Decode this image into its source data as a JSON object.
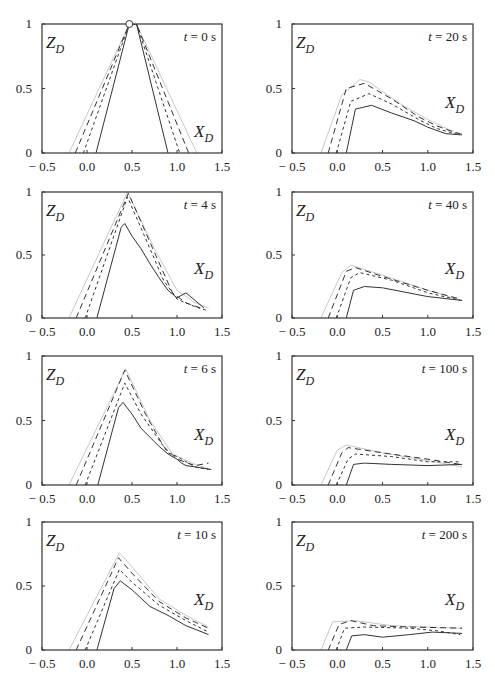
{
  "figure": {
    "ylabel": "Z",
    "ylabel_sub": "D",
    "xlabel": "X",
    "xlabel_sub": "D",
    "xticks": [
      "− 0.5",
      "0.0",
      "0.5",
      "1.0",
      "1.5"
    ],
    "xtick_values": [
      -0.5,
      0.0,
      0.5,
      1.0,
      1.5
    ],
    "yticks": [
      "0",
      "0.5",
      "1"
    ],
    "ytick_values": [
      0,
      0.5,
      1
    ],
    "line_styles": {
      "outer": {
        "stroke": "#c8c8c8",
        "dash": "",
        "width": 1
      },
      "dash_long": {
        "stroke": "#333333",
        "dash": "6,4",
        "width": 1
      },
      "dash_short": {
        "stroke": "#333333",
        "dash": "3,3",
        "width": 1
      },
      "solid": {
        "stroke": "#333333",
        "dash": "",
        "width": 1
      }
    }
  },
  "chart_data": [
    {
      "type": "line",
      "title": "t = 0 s",
      "xlabel": "X_D",
      "ylabel": "Z_D",
      "xlim": [
        -0.5,
        1.5
      ],
      "ylim": [
        0,
        1
      ],
      "marker": {
        "x": 0.47,
        "y": 1.0,
        "shape": "open-circle"
      },
      "series": [
        {
          "name": "outer",
          "points": [
            [
              -0.2,
              0
            ],
            [
              0.47,
              1.0
            ],
            [
              0.55,
              1.0
            ],
            [
              1.22,
              0
            ]
          ]
        },
        {
          "name": "dash_long",
          "points": [
            [
              -0.13,
              0
            ],
            [
              0.47,
              1.0
            ],
            [
              0.55,
              1.0
            ],
            [
              1.13,
              0
            ]
          ]
        },
        {
          "name": "dash_short",
          "points": [
            [
              -0.04,
              0
            ],
            [
              0.47,
              1.0
            ],
            [
              0.55,
              1.0
            ],
            [
              1.03,
              0
            ]
          ]
        },
        {
          "name": "solid",
          "points": [
            [
              0.1,
              0
            ],
            [
              0.47,
              1.0
            ],
            [
              0.55,
              1.0
            ],
            [
              0.9,
              0
            ]
          ]
        }
      ]
    },
    {
      "type": "line",
      "title": "t = 20 s",
      "xlabel": "X_D",
      "ylabel": "Z_D",
      "xlim": [
        -0.5,
        1.5
      ],
      "ylim": [
        0,
        1
      ],
      "series": [
        {
          "name": "outer",
          "points": [
            [
              -0.18,
              0
            ],
            [
              0.05,
              0.45
            ],
            [
              0.25,
              0.57
            ],
            [
              0.35,
              0.55
            ],
            [
              0.7,
              0.38
            ],
            [
              1.0,
              0.26
            ],
            [
              1.3,
              0.16
            ],
            [
              1.38,
              0.15
            ]
          ]
        },
        {
          "name": "dash_long",
          "points": [
            [
              -0.1,
              0
            ],
            [
              0.1,
              0.5
            ],
            [
              0.3,
              0.54
            ],
            [
              0.6,
              0.42
            ],
            [
              0.9,
              0.28
            ],
            [
              1.1,
              0.21
            ],
            [
              1.3,
              0.16
            ],
            [
              1.36,
              0.15
            ]
          ]
        },
        {
          "name": "dash_short",
          "points": [
            [
              -0.01,
              0
            ],
            [
              0.15,
              0.4
            ],
            [
              0.35,
              0.46
            ],
            [
              0.6,
              0.38
            ],
            [
              0.9,
              0.26
            ],
            [
              1.1,
              0.19
            ],
            [
              1.3,
              0.15
            ],
            [
              1.36,
              0.14
            ]
          ]
        },
        {
          "name": "solid",
          "points": [
            [
              0.1,
              0
            ],
            [
              0.2,
              0.34
            ],
            [
              0.38,
              0.37
            ],
            [
              0.6,
              0.31
            ],
            [
              0.85,
              0.25
            ],
            [
              1.0,
              0.2
            ],
            [
              1.2,
              0.15
            ],
            [
              1.38,
              0.14
            ]
          ]
        }
      ]
    },
    {
      "type": "line",
      "title": "t = 4 s",
      "xlabel": "X_D",
      "ylabel": "Z_D",
      "xlim": [
        -0.5,
        1.5
      ],
      "ylim": [
        0,
        1
      ],
      "series": [
        {
          "name": "outer",
          "points": [
            [
              -0.2,
              0
            ],
            [
              0.45,
              1.0
            ],
            [
              0.75,
              0.55
            ],
            [
              1.0,
              0.22
            ],
            [
              1.2,
              0.12
            ],
            [
              1.35,
              0.08
            ]
          ]
        },
        {
          "name": "dash_long",
          "points": [
            [
              -0.12,
              0
            ],
            [
              0.46,
              0.99
            ],
            [
              0.75,
              0.52
            ],
            [
              0.95,
              0.2
            ],
            [
              1.1,
              0.12
            ],
            [
              1.3,
              0.07
            ]
          ]
        },
        {
          "name": "dash_short",
          "points": [
            [
              -0.02,
              0
            ],
            [
              0.45,
              0.96
            ],
            [
              0.7,
              0.55
            ],
            [
              0.85,
              0.3
            ],
            [
              1.0,
              0.15
            ],
            [
              1.2,
              0.09
            ],
            [
              1.33,
              0.06
            ]
          ]
        },
        {
          "name": "solid",
          "points": [
            [
              0.11,
              0
            ],
            [
              0.38,
              0.72
            ],
            [
              0.42,
              0.75
            ],
            [
              0.5,
              0.65
            ],
            [
              0.6,
              0.55
            ],
            [
              0.7,
              0.43
            ],
            [
              0.8,
              0.32
            ],
            [
              0.9,
              0.22
            ],
            [
              1.0,
              0.16
            ],
            [
              1.1,
              0.2
            ],
            [
              1.2,
              0.14
            ],
            [
              1.3,
              0.08
            ]
          ]
        }
      ]
    },
    {
      "type": "line",
      "title": "t = 40 s",
      "xlabel": "X_D",
      "ylabel": "Z_D",
      "xlim": [
        -0.5,
        1.5
      ],
      "ylim": [
        0,
        1
      ],
      "series": [
        {
          "name": "outer",
          "points": [
            [
              -0.18,
              0
            ],
            [
              0.05,
              0.36
            ],
            [
              0.15,
              0.42
            ],
            [
              0.5,
              0.34
            ],
            [
              1.0,
              0.22
            ],
            [
              1.38,
              0.14
            ]
          ]
        },
        {
          "name": "dash_long",
          "points": [
            [
              -0.1,
              0
            ],
            [
              0.1,
              0.37
            ],
            [
              0.2,
              0.4
            ],
            [
              0.5,
              0.33
            ],
            [
              1.0,
              0.22
            ],
            [
              1.36,
              0.15
            ]
          ]
        },
        {
          "name": "dash_short",
          "points": [
            [
              -0.01,
              0
            ],
            [
              0.15,
              0.32
            ],
            [
              0.25,
              0.36
            ],
            [
              0.6,
              0.3
            ],
            [
              1.0,
              0.2
            ],
            [
              1.36,
              0.14
            ]
          ]
        },
        {
          "name": "solid",
          "points": [
            [
              0.1,
              0
            ],
            [
              0.18,
              0.22
            ],
            [
              0.3,
              0.25
            ],
            [
              0.5,
              0.24
            ],
            [
              1.0,
              0.17
            ],
            [
              1.38,
              0.14
            ]
          ]
        }
      ]
    },
    {
      "type": "line",
      "title": "t = 6 s",
      "xlabel": "X_D",
      "ylabel": "Z_D",
      "xlim": [
        -0.5,
        1.5
      ],
      "ylim": [
        0,
        1
      ],
      "series": [
        {
          "name": "outer",
          "points": [
            [
              -0.2,
              0
            ],
            [
              0.43,
              0.9
            ],
            [
              0.7,
              0.5
            ],
            [
              0.95,
              0.24
            ],
            [
              1.2,
              0.16
            ],
            [
              1.38,
              0.12
            ]
          ]
        },
        {
          "name": "dash_long",
          "points": [
            [
              -0.12,
              0
            ],
            [
              0.42,
              0.89
            ],
            [
              0.65,
              0.55
            ],
            [
              0.85,
              0.3
            ],
            [
              1.0,
              0.2
            ],
            [
              1.2,
              0.15
            ],
            [
              1.35,
              0.17
            ]
          ]
        },
        {
          "name": "dash_short",
          "points": [
            [
              -0.02,
              0
            ],
            [
              0.42,
              0.79
            ],
            [
              0.6,
              0.55
            ],
            [
              0.8,
              0.35
            ],
            [
              0.9,
              0.25
            ],
            [
              1.0,
              0.22
            ],
            [
              1.2,
              0.14
            ],
            [
              1.35,
              0.12
            ]
          ]
        },
        {
          "name": "solid",
          "points": [
            [
              0.12,
              0
            ],
            [
              0.35,
              0.6
            ],
            [
              0.4,
              0.64
            ],
            [
              0.5,
              0.55
            ],
            [
              0.6,
              0.44
            ],
            [
              0.7,
              0.37
            ],
            [
              0.8,
              0.3
            ],
            [
              0.9,
              0.24
            ],
            [
              1.0,
              0.2
            ],
            [
              1.05,
              0.17
            ],
            [
              1.1,
              0.15
            ],
            [
              1.2,
              0.14
            ],
            [
              1.38,
              0.12
            ]
          ]
        }
      ]
    },
    {
      "type": "line",
      "title": "t = 100 s",
      "xlabel": "X_D",
      "ylabel": "Z_D",
      "xlim": [
        -0.5,
        1.5
      ],
      "ylim": [
        0,
        1
      ],
      "series": [
        {
          "name": "outer",
          "points": [
            [
              -0.18,
              0
            ],
            [
              0.0,
              0.27
            ],
            [
              0.1,
              0.31
            ],
            [
              0.5,
              0.25
            ],
            [
              1.0,
              0.19
            ],
            [
              1.38,
              0.14
            ]
          ]
        },
        {
          "name": "dash_long",
          "points": [
            [
              -0.1,
              0
            ],
            [
              0.05,
              0.25
            ],
            [
              0.12,
              0.29
            ],
            [
              0.5,
              0.25
            ],
            [
              1.0,
              0.2
            ],
            [
              1.36,
              0.16
            ]
          ]
        },
        {
          "name": "dash_short",
          "points": [
            [
              -0.01,
              0
            ],
            [
              0.12,
              0.2
            ],
            [
              0.2,
              0.24
            ],
            [
              0.6,
              0.22
            ],
            [
              1.0,
              0.18
            ],
            [
              1.36,
              0.18
            ]
          ]
        },
        {
          "name": "solid",
          "points": [
            [
              0.1,
              0
            ],
            [
              0.18,
              0.16
            ],
            [
              0.3,
              0.17
            ],
            [
              0.6,
              0.16
            ],
            [
              1.0,
              0.15
            ],
            [
              1.38,
              0.16
            ]
          ]
        }
      ]
    },
    {
      "type": "line",
      "title": "t = 10 s",
      "xlabel": "X_D",
      "ylabel": "Z_D",
      "xlim": [
        -0.5,
        1.5
      ],
      "ylim": [
        0,
        1
      ],
      "series": [
        {
          "name": "outer",
          "points": [
            [
              -0.2,
              0
            ],
            [
              0.36,
              0.76
            ],
            [
              0.5,
              0.65
            ],
            [
              0.8,
              0.4
            ],
            [
              1.1,
              0.27
            ],
            [
              1.35,
              0.18
            ]
          ]
        },
        {
          "name": "dash_long",
          "points": [
            [
              -0.12,
              0
            ],
            [
              0.35,
              0.72
            ],
            [
              0.5,
              0.6
            ],
            [
              0.8,
              0.38
            ],
            [
              1.1,
              0.25
            ],
            [
              1.35,
              0.17
            ]
          ]
        },
        {
          "name": "dash_short",
          "points": [
            [
              -0.02,
              0
            ],
            [
              0.36,
              0.63
            ],
            [
              0.5,
              0.53
            ],
            [
              0.8,
              0.35
            ],
            [
              1.1,
              0.23
            ],
            [
              1.35,
              0.14
            ]
          ]
        },
        {
          "name": "solid",
          "points": [
            [
              0.11,
              0
            ],
            [
              0.3,
              0.48
            ],
            [
              0.37,
              0.54
            ],
            [
              0.5,
              0.47
            ],
            [
              0.7,
              0.34
            ],
            [
              0.9,
              0.27
            ],
            [
              1.1,
              0.19
            ],
            [
              1.35,
              0.12
            ]
          ]
        }
      ]
    },
    {
      "type": "line",
      "title": "t = 200 s",
      "xlabel": "X_D",
      "ylabel": "Z_D",
      "xlim": [
        -0.5,
        1.5
      ],
      "ylim": [
        0,
        1
      ],
      "series": [
        {
          "name": "outer",
          "points": [
            [
              -0.18,
              0
            ],
            [
              -0.05,
              0.22
            ],
            [
              0.2,
              0.23
            ],
            [
              0.6,
              0.19
            ],
            [
              1.0,
              0.18
            ],
            [
              1.38,
              0.17
            ]
          ]
        },
        {
          "name": "dash_long",
          "points": [
            [
              -0.1,
              0
            ],
            [
              0.02,
              0.2
            ],
            [
              0.15,
              0.23
            ],
            [
              0.4,
              0.19
            ],
            [
              0.8,
              0.18
            ],
            [
              1.38,
              0.17
            ]
          ]
        },
        {
          "name": "dash_short",
          "points": [
            [
              -0.01,
              0
            ],
            [
              0.08,
              0.17
            ],
            [
              0.3,
              0.18
            ],
            [
              0.8,
              0.17
            ],
            [
              1.1,
              0.15
            ],
            [
              1.36,
              0.12
            ]
          ]
        },
        {
          "name": "solid",
          "points": [
            [
              0.1,
              0
            ],
            [
              0.16,
              0.11
            ],
            [
              0.3,
              0.12
            ],
            [
              0.5,
              0.1
            ],
            [
              0.8,
              0.12
            ],
            [
              1.05,
              0.14
            ],
            [
              1.38,
              0.13
            ]
          ]
        }
      ]
    }
  ]
}
